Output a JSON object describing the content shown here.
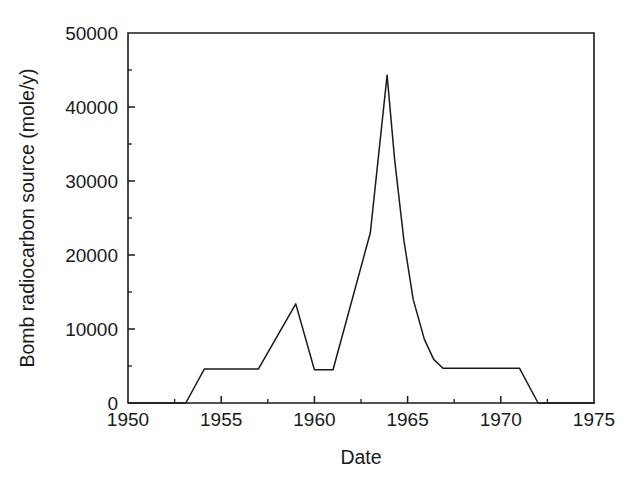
{
  "chart_data": {
    "type": "line",
    "title": "",
    "xlabel": "Date",
    "ylabel": "Bomb radiocarbon source (mole/y)",
    "xlim": [
      1950,
      1975
    ],
    "ylim": [
      0,
      50000
    ],
    "grid": false,
    "legend": null,
    "x_ticks": [
      1950,
      1955,
      1960,
      1965,
      1970,
      1975
    ],
    "x_tick_labels": [
      "1950",
      "1955",
      "1960",
      "1965",
      "1970",
      "1975"
    ],
    "x_minor_ticks": [
      1952.5,
      1957.5,
      1962.5,
      1967.5,
      1972.5
    ],
    "y_ticks": [
      0,
      10000,
      20000,
      30000,
      40000,
      50000
    ],
    "y_tick_labels": [
      "0",
      "10000",
      "20000",
      "30000",
      "40000",
      "50000"
    ],
    "y_minor_ticks": [
      5000,
      15000,
      25000,
      35000,
      45000
    ],
    "series": [
      {
        "name": "Bomb radiocarbon source",
        "color": "#1a1a1a",
        "x": [
          1950.0,
          1953.1,
          1954.1,
          1957.0,
          1959.0,
          1960.0,
          1961.0,
          1963.0,
          1963.9,
          1964.3,
          1964.8,
          1965.3,
          1965.9,
          1966.4,
          1966.9,
          1971.0,
          1972.0,
          1975.0
        ],
        "y": [
          0,
          0,
          4600,
          4600,
          13400,
          4500,
          4500,
          23000,
          44300,
          33000,
          22000,
          14000,
          8600,
          5900,
          4700,
          4700,
          0,
          0
        ]
      }
    ],
    "annotations": []
  },
  "axis_titles": {
    "x": "Date",
    "y": "Bomb radiocarbon source (mole/y)"
  }
}
